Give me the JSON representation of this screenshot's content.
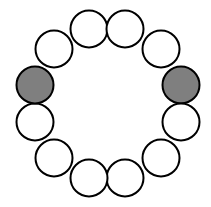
{
  "diagram": {
    "stroke_color": "#000000",
    "stroke_width": 2,
    "radius": 18.5,
    "circles": [
      {
        "cx": 89,
        "cy": 29,
        "fill": "#ffffff"
      },
      {
        "cx": 125,
        "cy": 29,
        "fill": "#ffffff"
      },
      {
        "cx": 161,
        "cy": 49,
        "fill": "#ffffff"
      },
      {
        "cx": 181,
        "cy": 85,
        "fill": "#7f7f7f"
      },
      {
        "cx": 181,
        "cy": 122,
        "fill": "#ffffff"
      },
      {
        "cx": 161,
        "cy": 158,
        "fill": "#ffffff"
      },
      {
        "cx": 125,
        "cy": 178,
        "fill": "#ffffff"
      },
      {
        "cx": 89,
        "cy": 178,
        "fill": "#ffffff"
      },
      {
        "cx": 54,
        "cy": 158,
        "fill": "#ffffff"
      },
      {
        "cx": 35,
        "cy": 122,
        "fill": "#ffffff"
      },
      {
        "cx": 35,
        "cy": 85,
        "fill": "#7f7f7f"
      },
      {
        "cx": 54,
        "cy": 49,
        "fill": "#ffffff"
      }
    ]
  }
}
